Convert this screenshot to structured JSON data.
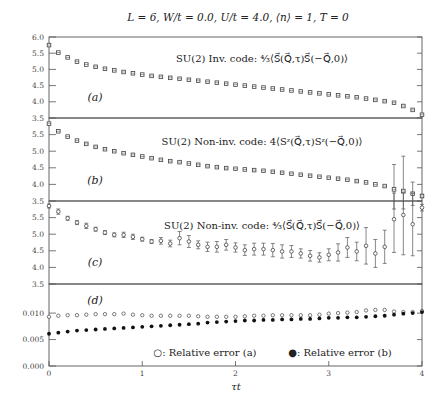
{
  "chart_data": {
    "type": "scatter",
    "title": "L = 6, W/t = 0.0, U/t = 4.0, ⟨n⟩ = 1, T = 0",
    "xlabel": "τt",
    "xlim": [
      0,
      4
    ],
    "x_ticks": [
      "0",
      "1",
      "2",
      "3",
      "4"
    ],
    "panels": [
      {
        "id": "a",
        "label": "(a)",
        "annotation": "SU(2) Inv. code: ⁴⁄₃⟨S⃗(Q⃗,τ)S⃗(−Q⃗,0)⟩",
        "ylim": [
          3.5,
          6.0
        ],
        "y_ticks": [
          "3.5",
          "4.0",
          "4.5",
          "5.0",
          "5.5",
          "6.0"
        ],
        "marker": "square",
        "x": [
          0,
          0.1,
          0.2,
          0.3,
          0.4,
          0.5,
          0.6,
          0.7,
          0.8,
          0.9,
          1.0,
          1.1,
          1.2,
          1.3,
          1.4,
          1.5,
          1.6,
          1.7,
          1.8,
          1.9,
          2.0,
          2.1,
          2.2,
          2.3,
          2.4,
          2.5,
          2.6,
          2.7,
          2.8,
          2.9,
          3.0,
          3.1,
          3.2,
          3.3,
          3.4,
          3.5,
          3.6,
          3.7,
          3.8,
          3.9,
          4.0
        ],
        "y": [
          5.75,
          5.52,
          5.37,
          5.24,
          5.15,
          5.08,
          5.02,
          4.97,
          4.92,
          4.88,
          4.84,
          4.8,
          4.77,
          4.74,
          4.71,
          4.68,
          4.65,
          4.62,
          4.59,
          4.56,
          4.53,
          4.5,
          4.47,
          4.44,
          4.41,
          4.38,
          4.35,
          4.32,
          4.29,
          4.26,
          4.23,
          4.2,
          4.17,
          4.14,
          4.1,
          4.06,
          4.02,
          3.97,
          3.87,
          3.75,
          3.6
        ],
        "err": [
          0.03,
          0.03,
          0.03,
          0.02,
          0.02,
          0.02,
          0.02,
          0.02,
          0.02,
          0.02,
          0.02,
          0.02,
          0.02,
          0.02,
          0.02,
          0.02,
          0.02,
          0.02,
          0.02,
          0.02,
          0.02,
          0.02,
          0.02,
          0.02,
          0.02,
          0.02,
          0.02,
          0.02,
          0.02,
          0.02,
          0.02,
          0.02,
          0.02,
          0.02,
          0.02,
          0.02,
          0.02,
          0.02,
          0.02,
          0.02,
          0.02
        ]
      },
      {
        "id": "b",
        "label": "(b)",
        "annotation": "SU(2) Non-inv. code: 4⟨Sᶻ(Q⃗,τ)Sᶻ(−Q⃗,0)⟩",
        "ylim": [
          3.5,
          6.0
        ],
        "y_ticks": [
          "3.5",
          "4.0",
          "4.5",
          "5.0",
          "5.5"
        ],
        "marker": "square",
        "x": [
          0,
          0.1,
          0.2,
          0.3,
          0.4,
          0.5,
          0.6,
          0.7,
          0.8,
          0.9,
          1.0,
          1.1,
          1.2,
          1.3,
          1.4,
          1.5,
          1.6,
          1.7,
          1.8,
          1.9,
          2.0,
          2.1,
          2.2,
          2.3,
          2.4,
          2.5,
          2.6,
          2.7,
          2.8,
          2.9,
          3.0,
          3.1,
          3.2,
          3.3,
          3.4,
          3.5,
          3.6,
          3.7,
          3.8,
          3.9,
          4.0
        ],
        "y": [
          5.83,
          5.6,
          5.44,
          5.32,
          5.22,
          5.13,
          5.06,
          5.0,
          4.94,
          4.89,
          4.84,
          4.79,
          4.74,
          4.7,
          4.67,
          4.63,
          4.59,
          4.55,
          4.52,
          4.49,
          4.47,
          4.45,
          4.43,
          4.41,
          4.38,
          4.35,
          4.32,
          4.29,
          4.26,
          4.23,
          4.2,
          4.17,
          4.14,
          4.1,
          4.06,
          4.0,
          3.95,
          3.85,
          3.8,
          3.72,
          3.65
        ],
        "err": [
          0.03,
          0.03,
          0.03,
          0.02,
          0.02,
          0.02,
          0.02,
          0.02,
          0.02,
          0.02,
          0.02,
          0.02,
          0.02,
          0.02,
          0.02,
          0.02,
          0.02,
          0.02,
          0.02,
          0.02,
          0.02,
          0.02,
          0.02,
          0.02,
          0.02,
          0.02,
          0.02,
          0.02,
          0.02,
          0.02,
          0.02,
          0.02,
          0.02,
          0.02,
          0.02,
          0.02,
          0.02,
          0.75,
          1.05,
          0.35,
          0.05
        ]
      },
      {
        "id": "c",
        "label": "(c)",
        "annotation": "SU(2) Non-inv. code: ⁴⁄₃⟨S⃗(Q⃗,τ)S⃗(−Q⃗,0)⟩",
        "ylim": [
          3.5,
          6.0
        ],
        "y_ticks": [
          "3.5",
          "4.0",
          "4.5",
          "5.0",
          "5.5"
        ],
        "marker": "circle",
        "x": [
          0,
          0.1,
          0.2,
          0.3,
          0.4,
          0.5,
          0.6,
          0.7,
          0.8,
          0.9,
          1.0,
          1.1,
          1.2,
          1.3,
          1.4,
          1.5,
          1.6,
          1.7,
          1.8,
          1.9,
          2.0,
          2.1,
          2.2,
          2.3,
          2.4,
          2.5,
          2.6,
          2.7,
          2.8,
          2.9,
          3.0,
          3.1,
          3.2,
          3.3,
          3.4,
          3.5,
          3.6,
          3.7,
          3.8,
          3.9,
          4.0
        ],
        "y": [
          5.85,
          5.68,
          5.48,
          5.35,
          5.25,
          5.15,
          5.05,
          4.98,
          4.98,
          4.92,
          4.85,
          4.78,
          4.8,
          4.72,
          4.88,
          4.78,
          4.68,
          4.62,
          4.62,
          4.68,
          4.6,
          4.52,
          4.55,
          4.55,
          4.52,
          4.48,
          4.48,
          4.42,
          4.35,
          4.3,
          4.38,
          4.45,
          4.6,
          4.48,
          4.65,
          4.42,
          4.62,
          5.45,
          5.58,
          5.3,
          5.8
        ],
        "err": [
          0.06,
          0.08,
          0.06,
          0.06,
          0.08,
          0.06,
          0.06,
          0.06,
          0.08,
          0.08,
          0.06,
          0.06,
          0.1,
          0.1,
          0.2,
          0.18,
          0.12,
          0.14,
          0.16,
          0.16,
          0.14,
          0.16,
          0.18,
          0.18,
          0.2,
          0.2,
          0.18,
          0.14,
          0.16,
          0.14,
          0.18,
          0.26,
          0.3,
          0.28,
          0.55,
          0.42,
          0.5,
          1.0,
          1.2,
          0.95,
          0.1
        ]
      },
      {
        "id": "d",
        "label": "(d)",
        "ylim": [
          0.0,
          0.0155
        ],
        "y_ticks": [
          "0.000",
          "0.005",
          "0.010"
        ],
        "series": [
          {
            "name": "○: Relative error (a)",
            "marker": "open-circle",
            "x": [
              0,
              0.1,
              0.2,
              0.3,
              0.4,
              0.5,
              0.6,
              0.7,
              0.8,
              0.9,
              1.0,
              1.1,
              1.2,
              1.3,
              1.4,
              1.5,
              1.6,
              1.7,
              1.8,
              1.9,
              2.0,
              2.1,
              2.2,
              2.3,
              2.4,
              2.5,
              2.6,
              2.7,
              2.8,
              2.9,
              3.0,
              3.1,
              3.2,
              3.3,
              3.4,
              3.5,
              3.6,
              3.7,
              3.8,
              3.9,
              4.0
            ],
            "y": [
              0.0093,
              0.0095,
              0.0096,
              0.0096,
              0.0097,
              0.0098,
              0.0098,
              0.0098,
              0.0099,
              0.0097,
              0.0096,
              0.0095,
              0.0095,
              0.0095,
              0.0095,
              0.0095,
              0.0094,
              0.0093,
              0.0093,
              0.0093,
              0.0093,
              0.0094,
              0.0095,
              0.0095,
              0.0096,
              0.0096,
              0.0096,
              0.0096,
              0.0096,
              0.0097,
              0.0099,
              0.01,
              0.0101,
              0.0102,
              0.0105,
              0.0106,
              0.0106,
              0.0103,
              0.0102,
              0.0102,
              0.0104
            ]
          },
          {
            "name": "●: Relative error (b)",
            "marker": "filled-circle",
            "x": [
              0,
              0.1,
              0.2,
              0.3,
              0.4,
              0.5,
              0.6,
              0.7,
              0.8,
              0.9,
              1.0,
              1.1,
              1.2,
              1.3,
              1.4,
              1.5,
              1.6,
              1.7,
              1.8,
              1.9,
              2.0,
              2.1,
              2.2,
              2.3,
              2.4,
              2.5,
              2.6,
              2.7,
              2.8,
              2.9,
              3.0,
              3.1,
              3.2,
              3.3,
              3.4,
              3.5,
              3.6,
              3.7,
              3.8,
              3.9,
              4.0
            ],
            "y": [
              0.0061,
              0.0063,
              0.0065,
              0.0067,
              0.0068,
              0.0069,
              0.007,
              0.0071,
              0.0072,
              0.0073,
              0.0074,
              0.0075,
              0.0076,
              0.0077,
              0.0078,
              0.0079,
              0.008,
              0.0082,
              0.0083,
              0.0084,
              0.0085,
              0.0086,
              0.0086,
              0.0087,
              0.0087,
              0.0088,
              0.0088,
              0.0089,
              0.0089,
              0.009,
              0.0091,
              0.0091,
              0.0092,
              0.0092,
              0.0093,
              0.0094,
              0.0095,
              0.0097,
              0.0099,
              0.01,
              0.0102
            ]
          }
        ]
      }
    ],
    "grid": false,
    "legend": "bottom (inside panel d)"
  }
}
